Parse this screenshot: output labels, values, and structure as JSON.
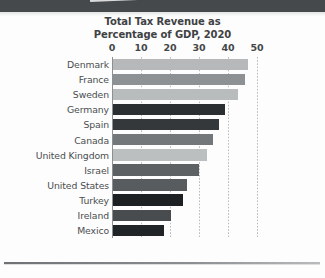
{
  "chart_data": {
    "type": "bar",
    "orientation": "horizontal",
    "title": "Total Tax Revenue as Percentage of GDP, 2020",
    "title_line1": "Total Tax Revenue as",
    "title_line2": "Percentage of GDP, 2020",
    "xlabel": "",
    "ylabel": "",
    "xlim": [
      0,
      50
    ],
    "xticks": [
      0,
      10,
      20,
      30,
      40,
      50
    ],
    "xtick_labels": [
      "0",
      "10",
      "20",
      "30",
      "40",
      "50"
    ],
    "grid": "vertical-dotted",
    "legend": "none",
    "categories": [
      "Denmark",
      "France",
      "Sweden",
      "Germany",
      "Spain",
      "Canada",
      "United Kingdom",
      "Israel",
      "United States",
      "Turkey",
      "Ireland",
      "Mexico"
    ],
    "values": [
      46.5,
      45.5,
      43,
      38.5,
      36.5,
      34.5,
      32.5,
      29.5,
      25.5,
      24,
      20,
      17.5
    ],
    "bar_colors": [
      "#b6b8b9",
      "#8e9193",
      "#b9bcbd",
      "#2c2f31",
      "#34383a",
      "#74777a",
      "#bcbfc0",
      "#5e6164",
      "#595c5f",
      "#1d2022",
      "#494c4f",
      "#212426"
    ]
  },
  "decor": {
    "banner_color": "#46494b",
    "streak_color": "#d9dadb",
    "rule_color": "#8c8f91"
  }
}
